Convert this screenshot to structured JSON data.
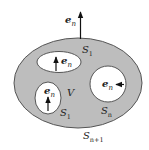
{
  "diagram": {
    "colors": {
      "region_fill": "#bdbdbd",
      "outline": "#555555",
      "hole_fill": "#ffffff",
      "arrow": "#111111"
    },
    "outer_normal": {
      "base": "e",
      "sub": "n"
    },
    "volume_label": "V",
    "surfaces": [
      {
        "id": "top-hole",
        "base": "S",
        "sub": "1",
        "normal": {
          "base": "e",
          "sub": "n"
        }
      },
      {
        "id": "left-hole",
        "base": "S",
        "sub": "1",
        "normal": {
          "base": "e",
          "sub": "n"
        }
      },
      {
        "id": "right-hole",
        "base": "S",
        "sub": "n",
        "normal": {
          "base": "e",
          "sub": "n"
        }
      },
      {
        "id": "outer",
        "base": "S",
        "sub": "n+1"
      }
    ]
  }
}
